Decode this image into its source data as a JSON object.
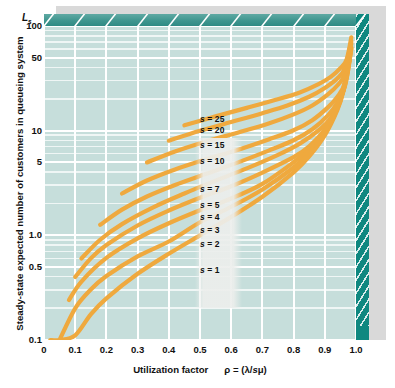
{
  "chart_data": {
    "type": "line",
    "title": "",
    "xlabel": "Utilization factor",
    "xlabel_symbol": "ρ = (λ/sμ)",
    "ylabel": "Steady-state expected number of customers in queueing system",
    "y_symbol": "L",
    "y_symbol_sub": "s",
    "yscale": "log",
    "ylim": [
      0.1,
      100
    ],
    "xlim": [
      0,
      1.0
    ],
    "grid": true,
    "legend_position": "inline-on-curves",
    "xticks": [
      "0",
      "0.1",
      "0.2",
      "0.3",
      "0.4",
      "0.5",
      "0.6",
      "0.7",
      "0.8",
      "0.9",
      "1.0"
    ],
    "xtick_values": [
      0,
      0.1,
      0.2,
      0.3,
      0.4,
      0.5,
      0.6,
      0.7,
      0.8,
      0.9,
      1.0
    ],
    "yticks": [
      "0.1",
      "0.5",
      "1.0",
      "5",
      "10",
      "50",
      "100"
    ],
    "ytick_values": [
      0.1,
      0.5,
      1.0,
      5,
      10,
      50,
      100
    ],
    "series": [
      {
        "name": "s = 1",
        "s": 1,
        "x": [
          0.02,
          0.05,
          0.1,
          0.15,
          0.2,
          0.3,
          0.4,
          0.5,
          0.6,
          0.7,
          0.8,
          0.85,
          0.9,
          0.94,
          0.96,
          0.98
        ],
        "y": [
          0.0204,
          0.0526,
          0.111,
          0.176,
          0.25,
          0.429,
          0.667,
          1.0,
          1.5,
          2.333,
          4.0,
          5.667,
          9.0,
          15.67,
          24.0,
          49.0
        ]
      },
      {
        "name": "s = 2",
        "s": 2,
        "x": [
          0.05,
          0.1,
          0.15,
          0.2,
          0.3,
          0.4,
          0.5,
          0.6,
          0.7,
          0.8,
          0.85,
          0.9,
          0.94,
          0.96,
          0.98
        ],
        "y": [
          0.1002,
          0.201,
          0.3034,
          0.4083,
          0.6293,
          0.8727,
          1.3333,
          1.875,
          2.745,
          4.444,
          6.133,
          9.474,
          16.1,
          24.5,
          49.5
        ]
      },
      {
        "name": "s = 3",
        "s": 3,
        "x": [
          0.08,
          0.12,
          0.2,
          0.3,
          0.4,
          0.5,
          0.6,
          0.7,
          0.8,
          0.85,
          0.9,
          0.94,
          0.96,
          0.98
        ],
        "y": [
          0.2405,
          0.362,
          0.6089,
          0.9353,
          1.3043,
          1.7368,
          2.25,
          3.0989,
          4.9883,
          6.64,
          9.9,
          16.5,
          24.9,
          49.9
        ]
      },
      {
        "name": "s = 4",
        "s": 4,
        "x": [
          0.1,
          0.15,
          0.2,
          0.3,
          0.4,
          0.5,
          0.6,
          0.7,
          0.8,
          0.85,
          0.9,
          0.94,
          0.96,
          0.98
        ],
        "y": [
          0.4004,
          0.6021,
          0.8082,
          1.2421,
          1.7255,
          2.2857,
          2.9455,
          3.9803,
          5.5858,
          7.09,
          10.241,
          16.8,
          25.2,
          50.2
        ]
      },
      {
        "name": "s = 5",
        "s": 5,
        "x": [
          0.12,
          0.18,
          0.25,
          0.35,
          0.45,
          0.55,
          0.65,
          0.75,
          0.82,
          0.88,
          0.92,
          0.95,
          0.97,
          0.985
        ],
        "y": [
          0.601,
          0.9073,
          1.2801,
          1.8504,
          2.51,
          3.33,
          4.36,
          5.87,
          7.52,
          10.05,
          13.3,
          19.8,
          31.5,
          62.0
        ]
      },
      {
        "name": "s = 7",
        "s": 7,
        "x": [
          0.18,
          0.25,
          0.33,
          0.42,
          0.52,
          0.62,
          0.72,
          0.8,
          0.86,
          0.91,
          0.94,
          0.965,
          0.985
        ],
        "y": [
          1.26,
          1.76,
          2.35,
          3.03,
          3.87,
          4.95,
          6.45,
          8.1,
          10.3,
          14.0,
          18.5,
          27.0,
          60.0
        ]
      },
      {
        "name": "s = 10",
        "s": 10,
        "x": [
          0.25,
          0.33,
          0.42,
          0.52,
          0.62,
          0.72,
          0.8,
          0.86,
          0.91,
          0.94,
          0.965,
          0.985
        ],
        "y": [
          2.51,
          3.34,
          4.26,
          5.33,
          6.55,
          8.25,
          10.1,
          12.6,
          16.7,
          21.0,
          29.0,
          62.0
        ]
      },
      {
        "name": "s = 15",
        "s": 15,
        "x": [
          0.33,
          0.42,
          0.52,
          0.62,
          0.72,
          0.8,
          0.86,
          0.91,
          0.94,
          0.965,
          0.985
        ],
        "y": [
          4.97,
          6.32,
          7.88,
          9.55,
          11.7,
          14.3,
          17.4,
          22.2,
          27.0,
          35.0,
          68.0
        ]
      },
      {
        "name": "s = 20",
        "s": 20,
        "x": [
          0.4,
          0.5,
          0.6,
          0.7,
          0.78,
          0.85,
          0.9,
          0.94,
          0.965,
          0.985
        ],
        "y": [
          8.03,
          9.98,
          12.1,
          14.7,
          17.4,
          21.1,
          25.6,
          31.5,
          40.0,
          72.0
        ]
      },
      {
        "name": "s = 25",
        "s": 25,
        "x": [
          0.45,
          0.55,
          0.65,
          0.74,
          0.82,
          0.88,
          0.92,
          0.95,
          0.97,
          0.985
        ],
        "y": [
          11.25,
          13.7,
          16.5,
          19.6,
          23.2,
          27.8,
          32.8,
          39.5,
          48.0,
          78.0
        ]
      }
    ]
  },
  "axis": {
    "y_symbol_html": "L",
    "y_symbol_sub": "s",
    "ytitle": "Steady-state expected number of customers in queueing system",
    "xtitle": "Utilization factor",
    "xtitle_symbol": "ρ = (λ/sμ)"
  },
  "colors": {
    "plot_background": "#c6dedb",
    "gridline": "#ffffff",
    "curve": "#efa93e",
    "slab_edge": "#0f8880",
    "slab_top": "#3f968f",
    "page_background": "#ffffff",
    "text": "#111111"
  }
}
